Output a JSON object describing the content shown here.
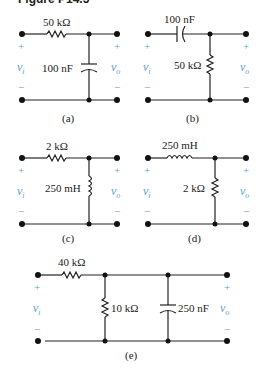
{
  "figure": {
    "title": "Figure P14.5"
  },
  "circuits": {
    "a": {
      "caption": "(a)",
      "series": {
        "label": "50 kΩ",
        "type": "resistor"
      },
      "shunt": [
        {
          "label": "100 nF",
          "type": "capacitor"
        }
      ],
      "input": {
        "plus": "+",
        "minus": "−",
        "label": "v",
        "sub": "i"
      },
      "output": {
        "plus": "+",
        "minus": "−",
        "label": "v",
        "sub": "o"
      }
    },
    "b": {
      "caption": "(b)",
      "series": {
        "label": "100 nF",
        "type": "capacitor"
      },
      "shunt": [
        {
          "label": "50 kΩ",
          "type": "resistor"
        }
      ],
      "input": {
        "plus": "+",
        "minus": "−",
        "label": "v",
        "sub": "i"
      },
      "output": {
        "plus": "+",
        "minus": "−",
        "label": "v",
        "sub": "o"
      }
    },
    "c": {
      "caption": "(c)",
      "series": {
        "label": "2 kΩ",
        "type": "resistor"
      },
      "shunt": [
        {
          "label": "250 mH",
          "type": "inductor"
        }
      ],
      "input": {
        "plus": "+",
        "minus": "−",
        "label": "v",
        "sub": "i"
      },
      "output": {
        "plus": "+",
        "minus": "−",
        "label": "v",
        "sub": "o"
      }
    },
    "d": {
      "caption": "(d)",
      "series": {
        "label": "250 mH",
        "type": "inductor"
      },
      "shunt": [
        {
          "label": "2 kΩ",
          "type": "resistor"
        }
      ],
      "input": {
        "plus": "+",
        "minus": "−",
        "label": "v",
        "sub": "i"
      },
      "output": {
        "plus": "+",
        "minus": "−",
        "label": "v",
        "sub": "o"
      }
    },
    "e": {
      "caption": "(e)",
      "series": {
        "label": "40 kΩ",
        "type": "resistor"
      },
      "shunt": [
        {
          "label": "10 kΩ",
          "type": "resistor"
        },
        {
          "label": "250 nF",
          "type": "capacitor"
        }
      ],
      "input": {
        "plus": "+",
        "minus": "−",
        "label": "v",
        "sub": "i"
      },
      "output": {
        "plus": "+",
        "minus": "−",
        "label": "v",
        "sub": "o"
      }
    }
  },
  "colors": {
    "wire": "#222222",
    "terminal_label": "#5ba3d0"
  }
}
